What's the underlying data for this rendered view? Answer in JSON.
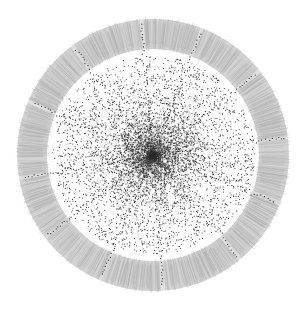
{
  "diagram": {
    "type": "network-graph",
    "layout": "radial",
    "center": {
      "x": 153,
      "y": 155
    },
    "outer_radius": 136,
    "ring_inner_radius": 106,
    "spokes": 12,
    "spoke_angle_offset_deg": -97,
    "colors": {
      "background": "#ffffff",
      "ring_edges": "#a9a9a9",
      "ring_fill": "#c4c4c4",
      "node": "#1a1a1a",
      "core_edges": "#444444"
    },
    "node_count_core": 5200,
    "ring_edge_count": 1400
  }
}
